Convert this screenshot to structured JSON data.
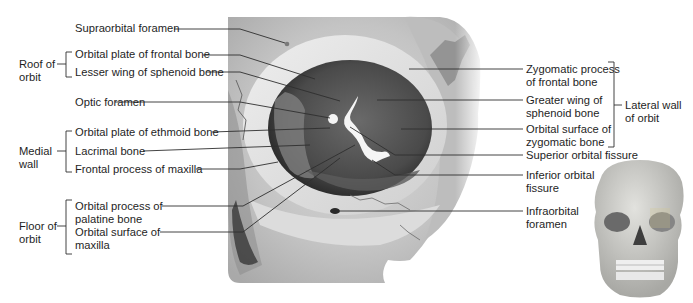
{
  "figure": {
    "type": "anatomical-diagram"
  },
  "left_labels": {
    "supraorbital_foramen": "Supraorbital foramen",
    "orbital_plate_frontal": "Orbital plate of frontal bone",
    "lesser_wing_sphenoid": "Lesser wing of sphenoid bone",
    "optic_foramen": "Optic foramen",
    "orbital_plate_ethmoid": "Orbital plate of ethmoid bone",
    "lacrimal_bone": "Lacrimal bone",
    "frontal_process_maxilla": "Frontal process of maxilla",
    "orbital_process_palatine_1": "Orbital process of",
    "orbital_process_palatine_2": "palatine bone",
    "orbital_surface_maxilla_1": "Orbital surface of",
    "orbital_surface_maxilla_2": "maxilla"
  },
  "left_groups": {
    "roof_1": "Roof of",
    "roof_2": "orbit",
    "medial_1": "Medial",
    "medial_2": "wall",
    "floor_1": "Floor of",
    "floor_2": "orbit"
  },
  "right_labels": {
    "zygomatic_process_frontal_1": "Zygomatic process",
    "zygomatic_process_frontal_2": "of frontal bone",
    "greater_wing_sphenoid_1": "Greater wing of",
    "greater_wing_sphenoid_2": "sphenoid bone",
    "orbital_surface_zygomatic_1": "Orbital surface of",
    "orbital_surface_zygomatic_2": "zygomatic bone",
    "superior_orbital_fissure": "Superior orbital fissure",
    "inferior_orbital_fissure_1": "Inferior orbital",
    "inferior_orbital_fissure_2": "fissure",
    "infraorbital_foramen_1": "Infraorbital",
    "infraorbital_foramen_2": "foramen"
  },
  "right_groups": {
    "lateral_1": "Lateral wall",
    "lateral_2": "of orbit"
  },
  "colors": {
    "leader_line": "#333333",
    "bone_light": "#e6e6e6",
    "orbit_dark": "#3a3a3a",
    "background": "#ffffff"
  }
}
